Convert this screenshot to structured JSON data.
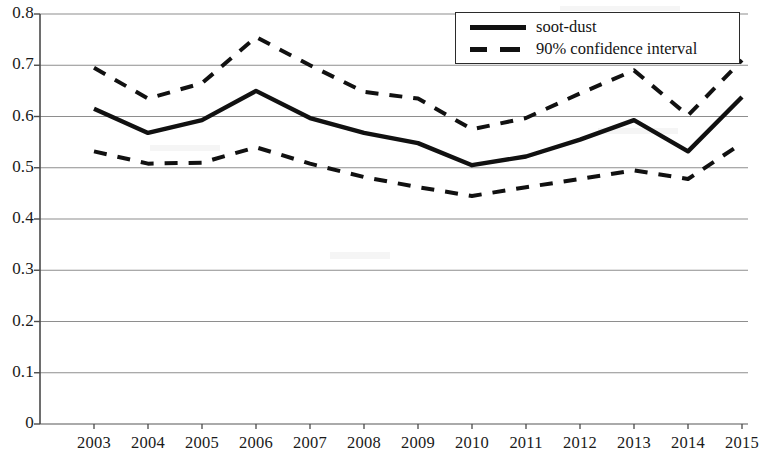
{
  "chart_data": {
    "type": "line",
    "title": "",
    "xlabel": "",
    "ylabel": "",
    "categories": [
      "2003",
      "2004",
      "2005",
      "2006",
      "2007",
      "2008",
      "2009",
      "2010",
      "2011",
      "2012",
      "2013",
      "2014",
      "2015"
    ],
    "ylim": [
      0,
      0.8
    ],
    "y_ticks": [
      "0",
      "0.1",
      "0.2",
      "0.3",
      "0.4",
      "0.5",
      "0.6",
      "0.7",
      "0.8"
    ],
    "y_tick_values": [
      0,
      0.1,
      0.2,
      0.3,
      0.4,
      0.5,
      0.6,
      0.7,
      0.8
    ],
    "grid": true,
    "legend_position": "top-right",
    "series": [
      {
        "name": "soot-dust",
        "style": "solid",
        "color": "#111111",
        "values": [
          0.615,
          0.568,
          0.593,
          0.65,
          0.597,
          0.568,
          0.548,
          0.505,
          0.522,
          0.555,
          0.593,
          0.532,
          0.638
        ]
      },
      {
        "name": "90% confidence interval",
        "style": "dashed",
        "color": "#111111",
        "bound": "upper",
        "values": [
          0.695,
          0.635,
          0.665,
          0.755,
          0.7,
          0.648,
          0.635,
          0.575,
          0.597,
          0.645,
          0.69,
          0.602,
          0.71
        ]
      },
      {
        "name": "90% confidence interval",
        "style": "dashed",
        "color": "#111111",
        "bound": "lower",
        "values": [
          0.532,
          0.508,
          0.51,
          0.54,
          0.508,
          0.482,
          0.462,
          0.445,
          0.462,
          0.478,
          0.495,
          0.478,
          0.548
        ]
      }
    ]
  },
  "legend": {
    "items": [
      {
        "label": "soot-dust",
        "style": "solid"
      },
      {
        "label": "90% confidence interval",
        "style": "dashed"
      }
    ]
  },
  "axes": {
    "y_labels": [
      "0.8",
      "0.7",
      "0.6",
      "0.5",
      "0.4",
      "0.3",
      "0.2",
      "0.1",
      "0"
    ],
    "x_labels": [
      "2003",
      "2004",
      "2005",
      "2006",
      "2007",
      "2008",
      "2009",
      "2010",
      "2011",
      "2012",
      "2013",
      "2014",
      "2015"
    ]
  },
  "colors": {
    "line": "#111111",
    "grid": "#8e8e8e",
    "axis": "#555555",
    "background": "#ffffff"
  }
}
